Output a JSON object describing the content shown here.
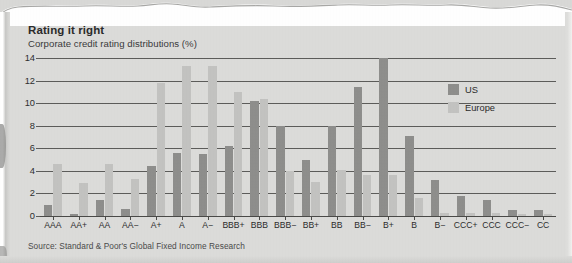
{
  "headline": "Rating it right",
  "subtitle": "Corporate credit rating distributions (%)",
  "source": "Source: Standard & Poor's Global Fixed Income Research",
  "legend": {
    "position": "top-right",
    "entries": [
      {
        "label": "US",
        "color": "#8e8e8c",
        "swatch_name": "legend-swatch-us"
      },
      {
        "label": "Europe",
        "color": "#c3c3c1",
        "swatch_name": "legend-swatch-europe"
      }
    ]
  },
  "chart_data": {
    "type": "bar",
    "title": "Rating it right",
    "subtitle": "Corporate credit rating distributions (%)",
    "xlabel": "",
    "ylabel": "",
    "ylim": [
      0,
      14
    ],
    "yticks": [
      0,
      2,
      4,
      6,
      8,
      10,
      12,
      14
    ],
    "ytick_labels": [
      "0",
      "2",
      "4",
      "6",
      "8",
      "10",
      "12",
      "14"
    ],
    "grid": true,
    "grid_axis": "y",
    "legend_position": "top-right",
    "categories": [
      "AAA",
      "AA+",
      "AA",
      "AA−",
      "A+",
      "A",
      "A−",
      "BBB+",
      "BBB",
      "BBB−",
      "BB+",
      "BB",
      "BB−",
      "B+",
      "B",
      "B−",
      "CCC+",
      "CCC",
      "CCC−",
      "CC"
    ],
    "series": [
      {
        "name": "US",
        "color": "#8e8e8c",
        "values": [
          1.0,
          0.2,
          1.4,
          0.6,
          4.4,
          5.6,
          5.5,
          6.2,
          10.2,
          8.0,
          5.0,
          8.0,
          11.4,
          14.0,
          7.1,
          3.2,
          1.8,
          1.4,
          0.5,
          0.5
        ]
      },
      {
        "name": "Europe",
        "color": "#c3c3c1",
        "values": [
          4.6,
          2.9,
          4.6,
          3.3,
          11.8,
          13.3,
          13.3,
          11.0,
          10.4,
          4.0,
          3.0,
          4.1,
          3.6,
          3.6,
          1.6,
          0.3,
          0.3,
          0.3,
          0.2,
          0.2
        ]
      }
    ]
  }
}
